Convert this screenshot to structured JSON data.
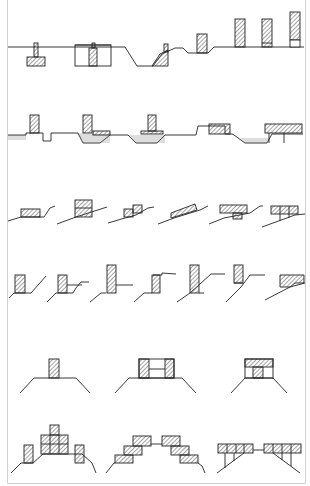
{
  "figure": {
    "colors": {
      "line": "#222222",
      "hatch": "#333333",
      "frame": "#cfcfcf",
      "background": "#ffffff",
      "water": "#555555"
    },
    "rows": [
      {
        "id": "row-1",
        "label": "wall-and-channel-sections",
        "panel_count": 1
      },
      {
        "id": "row-2",
        "label": "walls-in-water-channel-sections",
        "panel_count": 1
      },
      {
        "id": "row-3",
        "label": "slope-blocks",
        "panel_count": 6
      },
      {
        "id": "row-4",
        "label": "retaining-walls-on-slopes",
        "panel_count": 7
      },
      {
        "id": "row-5",
        "label": "embankment-crest-blocks",
        "panel_count": 3
      },
      {
        "id": "row-6",
        "label": "stepped-embankment-blocks",
        "panel_count": 3
      }
    ]
  }
}
